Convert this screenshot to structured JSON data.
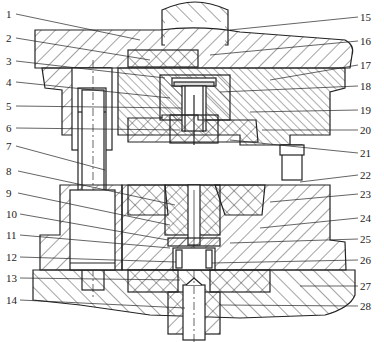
{
  "figure": {
    "stroke_color": "#222222",
    "hatch_color": "#333333",
    "background": "#ffffff"
  },
  "labels_left": [
    {
      "num": "1",
      "y": 9
    },
    {
      "num": "2",
      "y": 33
    },
    {
      "num": "3",
      "y": 56
    },
    {
      "num": "4",
      "y": 77
    },
    {
      "num": "5",
      "y": 101
    },
    {
      "num": "6",
      "y": 123
    },
    {
      "num": "7",
      "y": 141
    },
    {
      "num": "8",
      "y": 166
    },
    {
      "num": "9",
      "y": 188
    },
    {
      "num": "10",
      "y": 209
    },
    {
      "num": "11",
      "y": 230
    },
    {
      "num": "12",
      "y": 252
    },
    {
      "num": "13",
      "y": 273
    },
    {
      "num": "14",
      "y": 295
    }
  ],
  "labels_right": [
    {
      "num": "15",
      "y": 12
    },
    {
      "num": "16",
      "y": 36
    },
    {
      "num": "17",
      "y": 60
    },
    {
      "num": "18",
      "y": 81
    },
    {
      "num": "19",
      "y": 105
    },
    {
      "num": "20",
      "y": 125
    },
    {
      "num": "21",
      "y": 148
    },
    {
      "num": "22",
      "y": 170
    },
    {
      "num": "23",
      "y": 189
    },
    {
      "num": "24",
      "y": 213
    },
    {
      "num": "25",
      "y": 234
    },
    {
      "num": "26",
      "y": 255
    },
    {
      "num": "27",
      "y": 281
    },
    {
      "num": "28",
      "y": 301
    }
  ]
}
